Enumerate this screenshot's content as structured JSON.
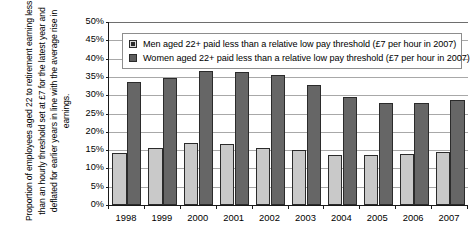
{
  "chart_data": {
    "type": "bar",
    "title": "",
    "subtitle": "",
    "xlabel": "",
    "ylabel": "Proportion of employees aged 22 to retirement earning less than an hourly threshold set at £7 for the latest year and deflated for earlier years in line with the average rise in earnings.",
    "categories": [
      "1998",
      "1999",
      "2000",
      "2001",
      "2002",
      "2003",
      "2004",
      "2005",
      "2006",
      "2007"
    ],
    "series": [
      {
        "name": "Men aged 22+ paid less than a relative low pay threshold (£7 per hour in 2007)",
        "color": "#c9c9c9",
        "values": [
          14.3,
          15.7,
          17.0,
          16.7,
          15.6,
          15.0,
          13.6,
          13.7,
          14.0,
          14.5
        ]
      },
      {
        "name": "Women aged 22+ paid less than a relative low pay threshold (£7 per hour in 2007)",
        "color": "#666666",
        "values": [
          33.7,
          34.6,
          36.6,
          36.3,
          35.4,
          32.8,
          29.5,
          28.0,
          27.8,
          28.6
        ]
      }
    ],
    "ylim": [
      0,
      50
    ],
    "ytick_step": 5,
    "ytick_labels": [
      "0%",
      "5%",
      "10%",
      "15%",
      "20%",
      "25%",
      "30%",
      "35%",
      "40%",
      "45%",
      "50%"
    ],
    "grid": true,
    "grid_axis": "y",
    "legend_position": "upper-left-inside",
    "value_suffix": "%"
  },
  "axis": {
    "y_title": "Proportion of employees aged 22 to retirement earning less than an hourly threshold set at £7 for the latest year and deflated for earlier years in line with the average rise in earnings."
  },
  "legend": {
    "items": [
      {
        "label": "Men aged 22+ paid less than a relative low pay threshold (£7 per hour in 2007)"
      },
      {
        "label": "Women aged 22+ paid less than a relative low pay threshold (£7 per hour in 2007)"
      }
    ]
  }
}
